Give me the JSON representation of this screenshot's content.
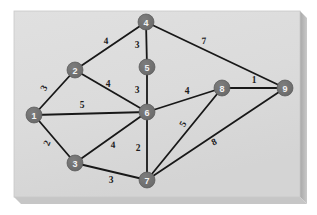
{
  "figure": {
    "panel": {
      "x": 14,
      "y": 11,
      "width": 286,
      "height": 186,
      "fill": "#dcdcdc",
      "border": "#c4c4c4",
      "shadow": "#b9b9b9"
    },
    "background": "#ffffff"
  },
  "style": {
    "node_fill": "#6e6e6e",
    "node_stroke": "#575757",
    "node_text": "#f2f2f2",
    "node_radius": 8,
    "edge_color": "#181818",
    "edge_width": 1.8,
    "weight_text": "#1c1c1c"
  },
  "graph_data": {
    "type": "graph",
    "directed": false,
    "weighted": true,
    "node_count": 9,
    "edge_count": 15,
    "nodes": [
      {
        "id": "1",
        "label": "1",
        "x": 34,
        "y": 115
      },
      {
        "id": "2",
        "label": "2",
        "x": 75,
        "y": 70
      },
      {
        "id": "3",
        "label": "3",
        "x": 75,
        "y": 163
      },
      {
        "id": "4",
        "label": "4",
        "x": 146,
        "y": 22
      },
      {
        "id": "5",
        "label": "5",
        "x": 147,
        "y": 67
      },
      {
        "id": "6",
        "label": "6",
        "x": 147,
        "y": 112
      },
      {
        "id": "7",
        "label": "7",
        "x": 147,
        "y": 180
      },
      {
        "id": "8",
        "label": "8",
        "x": 222,
        "y": 88
      },
      {
        "id": "9",
        "label": "9",
        "x": 285,
        "y": 88
      }
    ],
    "edges": [
      {
        "source": "1",
        "target": "2",
        "weight": "3",
        "lx": 44,
        "ly": 88,
        "rot": -62
      },
      {
        "source": "1",
        "target": "6",
        "weight": "5",
        "lx": 82,
        "ly": 105,
        "rot": 0
      },
      {
        "source": "1",
        "target": "3",
        "weight": "2",
        "lx": 47,
        "ly": 143,
        "rot": -66
      },
      {
        "source": "2",
        "target": "4",
        "weight": "4",
        "lx": 106,
        "ly": 41,
        "rot": -2
      },
      {
        "source": "2",
        "target": "6",
        "weight": "4",
        "lx": 108,
        "ly": 84,
        "rot": 0
      },
      {
        "source": "2",
        "target": "4",
        "weight": "",
        "lx": 0,
        "ly": 0,
        "rot": 0
      },
      {
        "source": "4",
        "target": "5",
        "weight": "3",
        "lx": 137,
        "ly": 45,
        "rot": 0
      },
      {
        "source": "4",
        "target": "9",
        "weight": "7",
        "lx": 204,
        "ly": 41,
        "rot": -3
      },
      {
        "source": "5",
        "target": "6",
        "weight": "3",
        "lx": 137,
        "ly": 90,
        "rot": 0
      },
      {
        "source": "3",
        "target": "6",
        "weight": "4",
        "lx": 113,
        "ly": 145,
        "rot": -2
      },
      {
        "source": "3",
        "target": "7",
        "weight": "3",
        "lx": 111,
        "ly": 180,
        "rot": 0
      },
      {
        "source": "6",
        "target": "7",
        "weight": "2",
        "lx": 138,
        "ly": 148,
        "rot": 0
      },
      {
        "source": "6",
        "target": "8",
        "weight": "4",
        "lx": 187,
        "ly": 91,
        "rot": 0
      },
      {
        "source": "7",
        "target": "8",
        "weight": "5",
        "lx": 183,
        "ly": 124,
        "rot": -62
      },
      {
        "source": "7",
        "target": "9",
        "weight": "8",
        "lx": 214,
        "ly": 142,
        "rot": -26
      },
      {
        "source": "8",
        "target": "9",
        "weight": "1",
        "lx": 254,
        "ly": 80,
        "rot": 0
      }
    ],
    "adjacency_list": {
      "1": [
        [
          "2",
          "3"
        ],
        [
          "6",
          "5"
        ],
        [
          "3",
          "2"
        ]
      ],
      "2": [
        [
          "1",
          "3"
        ],
        [
          "4",
          "4"
        ],
        [
          "6",
          "4"
        ]
      ],
      "3": [
        [
          "1",
          "2"
        ],
        [
          "6",
          "4"
        ],
        [
          "7",
          "3"
        ]
      ],
      "4": [
        [
          "2",
          "4"
        ],
        [
          "5",
          "3"
        ],
        [
          "9",
          "7"
        ]
      ],
      "5": [
        [
          "4",
          "3"
        ],
        [
          "6",
          "3"
        ]
      ],
      "6": [
        [
          "1",
          "5"
        ],
        [
          "2",
          "4"
        ],
        [
          "5",
          "3"
        ],
        [
          "3",
          "4"
        ],
        [
          "7",
          "2"
        ],
        [
          "8",
          "4"
        ]
      ],
      "7": [
        [
          "3",
          "3"
        ],
        [
          "6",
          "2"
        ],
        [
          "8",
          "5"
        ],
        [
          "9",
          "8"
        ]
      ],
      "8": [
        [
          "6",
          "4"
        ],
        [
          "7",
          "5"
        ],
        [
          "9",
          "1"
        ]
      ],
      "9": [
        [
          "4",
          "7"
        ],
        [
          "7",
          "8"
        ],
        [
          "8",
          "1"
        ]
      ]
    }
  }
}
